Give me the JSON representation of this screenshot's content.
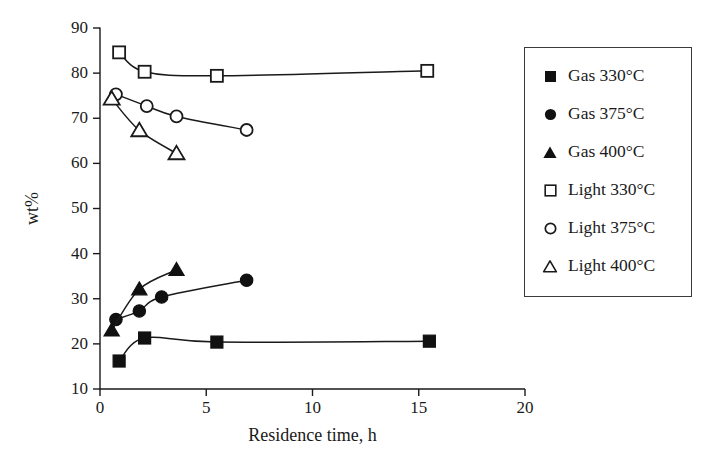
{
  "chart_data": {
    "type": "line",
    "title": "",
    "xlabel": "Residence time, h",
    "ylabel": "wt%",
    "xlim": [
      0,
      20
    ],
    "ylim": [
      10,
      90
    ],
    "xticks": [
      0,
      5,
      10,
      15,
      20
    ],
    "yticks": [
      10,
      20,
      30,
      40,
      50,
      60,
      70,
      80,
      90
    ],
    "grid": false,
    "legend_position": "right-outside",
    "series": [
      {
        "name": "Gas 330°C",
        "marker": "filled-square",
        "x": [
          0.9,
          2.1,
          5.5,
          15.5
        ],
        "y": [
          16.2,
          21.3,
          20.4,
          20.6
        ]
      },
      {
        "name": "Gas 375°C",
        "marker": "filled-circle",
        "x": [
          0.75,
          1.85,
          2.9,
          6.9
        ],
        "y": [
          25.4,
          27.3,
          30.4,
          34.1
        ]
      },
      {
        "name": "Gas 400°C",
        "marker": "filled-triangle",
        "x": [
          0.55,
          1.85,
          3.6
        ],
        "y": [
          23.0,
          32.1,
          36.4
        ]
      },
      {
        "name": "Light 330°C",
        "marker": "open-square",
        "x": [
          0.9,
          2.1,
          5.5,
          15.4
        ],
        "y": [
          84.6,
          80.3,
          79.4,
          80.5
        ]
      },
      {
        "name": "Light 375°C",
        "marker": "open-circle",
        "x": [
          0.75,
          2.2,
          3.6,
          6.9
        ],
        "y": [
          75.3,
          72.7,
          70.4,
          67.4
        ]
      },
      {
        "name": "Light 400°C",
        "marker": "open-triangle",
        "x": [
          0.55,
          1.85,
          3.6
        ],
        "y": [
          74.3,
          67.3,
          62.2
        ]
      }
    ]
  },
  "axes": {
    "x_title": "Residence time, h",
    "y_title": "wt%",
    "x_tick_labels": [
      "0",
      "5",
      "10",
      "15",
      "20"
    ],
    "y_tick_labels": [
      "10",
      "20",
      "30",
      "40",
      "50",
      "60",
      "70",
      "80",
      "90"
    ]
  },
  "legend": {
    "items": [
      {
        "label": "Gas 330°C",
        "marker": "filled-square"
      },
      {
        "label": "Gas 375°C",
        "marker": "filled-circle"
      },
      {
        "label": "Gas 400°C",
        "marker": "filled-triangle"
      },
      {
        "label": "Light 330°C",
        "marker": "open-square"
      },
      {
        "label": "Light 375°C",
        "marker": "open-circle"
      },
      {
        "label": "Light 400°C",
        "marker": "open-triangle"
      }
    ]
  },
  "colors": {
    "ink": "#1a1a1a",
    "marker_fill": "#111111",
    "marker_open_fill": "#ffffff",
    "background": "#ffffff"
  }
}
